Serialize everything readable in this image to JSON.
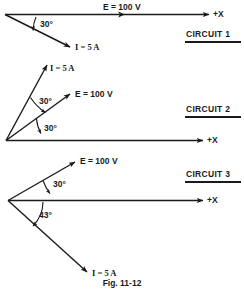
{
  "figure": {
    "caption": "Fig. 11-12",
    "axis_label": "+X"
  },
  "circuits": [
    {
      "name": "CIRCUIT 1",
      "voltage_label": "E = 100 V",
      "current_label": "I = 5 A",
      "angles": [
        "30°"
      ],
      "current_angle_deg": -30,
      "voltage_angle_deg": 0
    },
    {
      "name": "CIRCUIT 2",
      "voltage_label": "E = 100 V",
      "current_label": "I = 5 A",
      "angles": [
        "30°",
        "30°"
      ],
      "current_angle_deg": 60,
      "voltage_angle_deg": 30
    },
    {
      "name": "CIRCUIT 3",
      "voltage_label": "E = 100 V",
      "current_label": "I = 5 A",
      "angles": [
        "30°",
        "43°"
      ],
      "current_angle_deg": -43,
      "voltage_angle_deg": 30
    }
  ],
  "axis_labels": {
    "c1": "+X",
    "c2": "+X",
    "c3": "+X"
  },
  "colors": {
    "ink": "#1a1a1a",
    "paper": "#ffffff"
  }
}
